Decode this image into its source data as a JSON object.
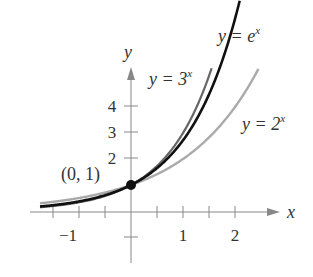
{
  "chart_data": {
    "type": "line",
    "title": "",
    "xlabel": "x",
    "ylabel": "y",
    "xlim": [
      -1.75,
      2.6
    ],
    "ylim": [
      -1.5,
      5.2
    ],
    "x_ticks": [
      -1.5,
      -1,
      -0.5,
      0.5,
      1,
      1.5,
      2
    ],
    "x_tick_labels": [
      "-1",
      "1",
      "2"
    ],
    "y_ticks": [
      -1,
      2,
      3,
      4
    ],
    "y_tick_labels": [
      "2",
      "3",
      "4"
    ],
    "grid": false,
    "series": [
      {
        "name": "y = 3^x",
        "function": "3^x",
        "x_range": [
          -1.75,
          1.55
        ],
        "color": "#666666",
        "width": 2.2
      },
      {
        "name": "y = e^x",
        "function": "e^x",
        "x_range": [
          -1.75,
          2.1
        ],
        "color": "#111111",
        "width": 2.6
      },
      {
        "name": "y = 2^x",
        "function": "2^x",
        "x_range": [
          -1.75,
          2.45
        ],
        "color": "#aaaaaa",
        "width": 2.4
      }
    ],
    "annotations": [
      {
        "text": "(0, 1)",
        "point": [
          0,
          1
        ]
      },
      {
        "text": "y = 3^x",
        "label": "y = 3",
        "sup": "x"
      },
      {
        "text": "y = e^x",
        "label": "y = e",
        "sup": "x"
      },
      {
        "text": "y = 2^x",
        "label": "y = 2",
        "sup": "x"
      }
    ]
  },
  "labels": {
    "x_axis": "x",
    "y_axis": "y",
    "point": "(0, 1)",
    "tick_x_neg1": "−1",
    "tick_x_1": "1",
    "tick_x_2": "2",
    "tick_y_2": "2",
    "tick_y_3": "3",
    "tick_y_4": "4",
    "eq3_base": "y = 3",
    "eq3_sup": "x",
    "eqe_base": "y = e",
    "eqe_sup": "x",
    "eq2_base": "y = 2",
    "eq2_sup": "x"
  }
}
